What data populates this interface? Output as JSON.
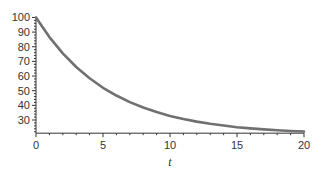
{
  "chart_data": {
    "type": "line",
    "title": "",
    "xlabel": "t",
    "ylabel": "",
    "xlim": [
      0,
      20
    ],
    "ylim": [
      21,
      100
    ],
    "grid": false,
    "legend": null,
    "x_ticks": [
      0,
      5,
      10,
      15,
      20
    ],
    "x_tick_labels": [
      "0",
      "5",
      "10",
      "15",
      "20"
    ],
    "y_ticks": [
      30,
      40,
      50,
      60,
      70,
      80,
      90,
      100
    ],
    "y_tick_labels": [
      "30",
      "40",
      "50",
      "60",
      "70",
      "80",
      "90",
      "100"
    ],
    "series": [
      {
        "name": "decay",
        "color": "#707070",
        "x": [
          0,
          1,
          2,
          3,
          4,
          5,
          6,
          7,
          8,
          9,
          10,
          11,
          12,
          13,
          14,
          15,
          16,
          17,
          18,
          19,
          20
        ],
        "y": [
          100,
          86.6,
          75.5,
          66.2,
          58.5,
          52.0,
          46.7,
          42.2,
          38.5,
          35.4,
          32.8,
          30.7,
          28.9,
          27.4,
          26.2,
          25.1,
          24.3,
          23.6,
          23.0,
          22.5,
          22.1
        ]
      }
    ]
  },
  "colors": {
    "axis": "#333333",
    "line": "#707070",
    "background": "#ffffff"
  }
}
